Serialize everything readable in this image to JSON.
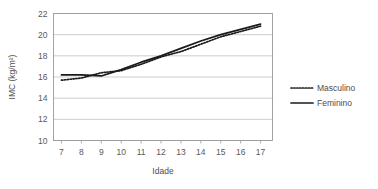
{
  "chart_data": {
    "type": "line",
    "title": "",
    "xlabel": "Idade",
    "ylabel": "IMC (kg/m²)",
    "x": [
      7,
      8,
      9,
      10,
      11,
      12,
      13,
      14,
      15,
      16,
      17
    ],
    "xtick_labels": [
      "7",
      "8",
      "9",
      "10",
      "11",
      "12",
      "13",
      "14",
      "15",
      "16",
      "17"
    ],
    "ytick_labels": [
      "10",
      "12",
      "14",
      "16",
      "18",
      "20",
      "22"
    ],
    "yticks": [
      10,
      12,
      14,
      16,
      18,
      20,
      22
    ],
    "xlim": [
      6.6,
      17.6
    ],
    "ylim": [
      10,
      22
    ],
    "grid": "horizontal",
    "legend_position": "right",
    "series": [
      {
        "name": "Masculino",
        "style": "dotted",
        "color": "#1a1a1a",
        "values": [
          15.7,
          15.9,
          16.4,
          16.6,
          17.2,
          17.9,
          18.4,
          19.1,
          19.8,
          20.3,
          20.8
        ]
      },
      {
        "name": "Feminino",
        "style": "solid",
        "color": "#1a1a1a",
        "values": [
          16.2,
          16.2,
          16.1,
          16.7,
          17.4,
          18.0,
          18.7,
          19.4,
          20.0,
          20.5,
          21.0
        ]
      }
    ]
  },
  "legend": {
    "items": [
      {
        "label": "Masculino",
        "style": "dotted"
      },
      {
        "label": "Feminino",
        "style": "solid"
      }
    ]
  },
  "axes": {
    "x_title": "Idade",
    "y_title": "IMC (kg/m²)"
  }
}
